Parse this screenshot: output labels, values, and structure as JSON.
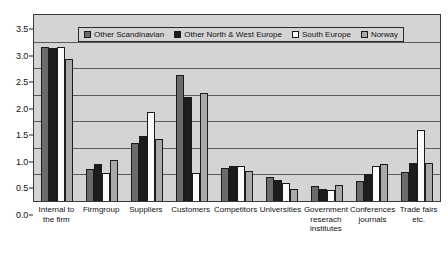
{
  "chart_data": {
    "type": "bar",
    "title": "",
    "xlabel": "",
    "ylabel": "",
    "ylim": [
      0.0,
      3.5
    ],
    "ytick_labels": [
      "3.5",
      "3.0",
      "2.5",
      "2.0",
      "1.5",
      "1.0",
      "0.5",
      "0.0"
    ],
    "ytick_values": [
      3.5,
      3.0,
      2.5,
      2.0,
      1.5,
      1.0,
      0.5,
      0.0
    ],
    "grid": true,
    "legend_position": "top-center",
    "categories": [
      "Internal to the firm",
      "Firmgroup",
      "Suppliers",
      "Customers",
      "Competitors",
      "Universities",
      "Government reserach institutes",
      "Conferences journals",
      "Trade fairs etc."
    ],
    "series": [
      {
        "name": "Other Scandinavian",
        "color": "#6b6b6b",
        "values": [
          2.9,
          0.61,
          1.1,
          2.38,
          0.62,
          0.45,
          0.28,
          0.38,
          0.55
        ]
      },
      {
        "name": "Other North & West Europe",
        "color": "#1c1c1c",
        "values": [
          2.88,
          0.69,
          1.22,
          1.95,
          0.65,
          0.4,
          0.22,
          0.5,
          0.72
        ]
      },
      {
        "name": "South Europe",
        "color": "#fbfbfb",
        "values": [
          2.9,
          0.52,
          1.68,
          0.52,
          0.66,
          0.34,
          0.2,
          0.66,
          1.33
        ]
      },
      {
        "name": "Norway",
        "color": "#a9a9a9",
        "values": [
          2.68,
          0.78,
          1.17,
          2.03,
          0.57,
          0.23,
          0.3,
          0.7,
          0.72
        ]
      }
    ]
  },
  "legend": {
    "items": [
      {
        "label": "Other Scandinavian",
        "swatch": "legend-swatch-other-scandinavian"
      },
      {
        "label": "Other North & West Europe",
        "swatch": "legend-swatch-other-north-west-europe"
      },
      {
        "label": "South Europe",
        "swatch": "legend-swatch-south-europe"
      },
      {
        "label": "Norway",
        "swatch": "legend-swatch-norway"
      }
    ]
  }
}
